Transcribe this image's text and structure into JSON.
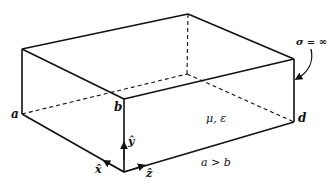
{
  "figure": {
    "type": "rectangular cavity diagram",
    "vertices": {
      "top_left": [
        22,
        49
      ],
      "top_back": [
        188,
        14
      ],
      "top_right": [
        294,
        59
      ],
      "top_front": [
        124,
        99
      ],
      "bottom_left_a": [
        22,
        114
      ],
      "bottom_front": [
        124,
        172
      ],
      "bottom_right_d": [
        294,
        122
      ],
      "bottom_back_hidden": [
        187,
        74
      ]
    },
    "labels": {
      "a": "a",
      "b": "b",
      "d": "d",
      "medium": "μ, ε",
      "conductivity": "σ = ∞",
      "condition": "a > b",
      "x_axis": "x̂",
      "y_axis": "ŷ",
      "z_axis": "ẑ"
    },
    "colors": {
      "line": "#111111",
      "background": "#ffffff"
    }
  }
}
